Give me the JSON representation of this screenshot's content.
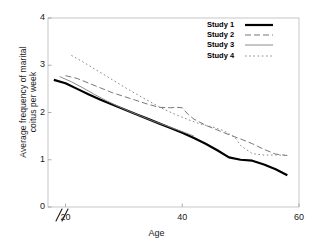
{
  "chart_data": {
    "type": "line",
    "title": "",
    "xlabel": "Age",
    "ylabel_line1": "Average frequency of marital",
    "ylabel_line2": "coitus per week",
    "xlim": [
      17,
      60
    ],
    "ylim": [
      0,
      4
    ],
    "xticks": [
      20,
      40,
      60
    ],
    "xtick_labels": [
      "20",
      "40",
      "60"
    ],
    "yticks": [
      0,
      1,
      2,
      3,
      4
    ],
    "ytick_labels": [
      "0",
      "1",
      "2",
      "3",
      "4"
    ],
    "grid": false,
    "axis_break": "//",
    "legend_position": "top-right",
    "series": [
      {
        "name": "Study 1",
        "style": "solid-thick",
        "color": "#000000",
        "width": 2.2,
        "dash": "",
        "x": [
          18,
          20,
          22,
          24,
          26,
          28,
          30,
          32,
          34,
          36,
          38,
          40,
          42,
          44,
          46,
          48,
          50,
          52,
          54,
          56,
          58
        ],
        "y": [
          2.69,
          2.62,
          2.5,
          2.38,
          2.27,
          2.17,
          2.07,
          1.97,
          1.87,
          1.77,
          1.67,
          1.57,
          1.46,
          1.34,
          1.2,
          1.05,
          1.0,
          0.98,
          0.9,
          0.8,
          0.67
        ]
      },
      {
        "name": "Study 2",
        "style": "dashed",
        "color": "#777777",
        "width": 1.0,
        "dash": "6 3",
        "x": [
          20,
          22,
          24,
          26,
          28,
          30,
          32,
          34,
          36,
          38,
          39,
          40,
          41,
          42,
          44,
          46,
          48,
          50,
          52,
          54,
          56,
          58
        ],
        "y": [
          2.78,
          2.72,
          2.62,
          2.52,
          2.42,
          2.34,
          2.26,
          2.18,
          2.11,
          2.1,
          2.11,
          2.1,
          1.96,
          1.86,
          1.73,
          1.63,
          1.53,
          1.44,
          1.34,
          1.22,
          1.12,
          1.09
        ]
      },
      {
        "name": "Study 3",
        "style": "solid-thin",
        "color": "#808080",
        "width": 0.9,
        "dash": "",
        "x": [
          19,
          21,
          23,
          25,
          27,
          29,
          31,
          33,
          35,
          37,
          39,
          41,
          42
        ],
        "y": [
          2.76,
          2.65,
          2.52,
          2.38,
          2.25,
          2.13,
          2.02,
          1.92,
          1.82,
          1.73,
          1.64,
          1.55,
          1.5
        ]
      },
      {
        "name": "Study 4",
        "style": "dotted",
        "color": "#8a8a8a",
        "width": 1.0,
        "dash": "1.6 2.6",
        "x": [
          21,
          23,
          25,
          27,
          29,
          31,
          33,
          35,
          37,
          39,
          41,
          43,
          45,
          47,
          49,
          50,
          52,
          54,
          56,
          58
        ],
        "y": [
          3.21,
          3.07,
          2.92,
          2.77,
          2.62,
          2.47,
          2.33,
          2.19,
          2.06,
          1.95,
          1.85,
          1.76,
          1.7,
          1.62,
          1.48,
          1.3,
          1.13,
          1.1,
          1.1,
          1.09
        ]
      }
    ]
  },
  "axis": {
    "break_marker": "//"
  }
}
